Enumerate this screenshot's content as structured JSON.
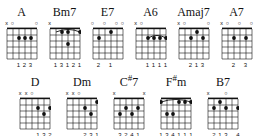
{
  "sheet": {
    "title": "Guitar Chord Chart",
    "strings": 6,
    "frets": 5,
    "ink_color": "#111111",
    "paper_color": "#ffffff"
  },
  "rows": [
    {
      "chords": [
        {
          "name": "A",
          "name_root": "A",
          "name_suffix": "",
          "markers": [
            "x",
            "o",
            "",
            "",
            "",
            "o"
          ],
          "dots": [
            {
              "string": 3,
              "fret": 2
            },
            {
              "string": 4,
              "fret": 2
            },
            {
              "string": 5,
              "fret": 2
            }
          ],
          "barre": null,
          "fingers": [
            "",
            "",
            "1",
            "2",
            "3",
            ""
          ]
        },
        {
          "name": "Bm7",
          "name_root": "Bm",
          "name_suffix": "7",
          "markers": [
            "x",
            "",
            "",
            "",
            "",
            ""
          ],
          "dots": [
            {
              "string": 3,
              "fret": 1
            },
            {
              "string": 4,
              "fret": 1
            },
            {
              "string": 6,
              "fret": 1
            },
            {
              "string": 4,
              "fret": 3
            }
          ],
          "barre": {
            "fret": 1,
            "from": 2,
            "to": 6
          },
          "fingers": [
            "",
            "1",
            "3",
            "1",
            "2",
            "1"
          ]
        },
        {
          "name": "E7",
          "name_root": "E",
          "name_suffix": "7",
          "markers": [
            "o",
            "",
            "o",
            "",
            "o",
            "o"
          ],
          "dots": [
            {
              "string": 2,
              "fret": 2
            },
            {
              "string": 4,
              "fret": 1
            }
          ],
          "barre": null,
          "fingers": [
            "",
            "2",
            "",
            "1",
            "",
            ""
          ]
        },
        {
          "name": "A6",
          "name_root": "A",
          "name_suffix": "6",
          "markers": [
            "x",
            "o",
            "",
            "",
            "",
            ""
          ],
          "dots": [
            {
              "string": 3,
              "fret": 2
            },
            {
              "string": 4,
              "fret": 2
            },
            {
              "string": 5,
              "fret": 2
            },
            {
              "string": 6,
              "fret": 2
            }
          ],
          "barre": {
            "fret": 2,
            "from": 3,
            "to": 6
          },
          "fingers": [
            "",
            "",
            "1",
            "1",
            "1",
            "1"
          ]
        },
        {
          "name": "Amaj7",
          "name_root": "Amaj",
          "name_suffix": "7",
          "markers": [
            "x",
            "o",
            "",
            "",
            "",
            "o"
          ],
          "dots": [
            {
              "string": 3,
              "fret": 2
            },
            {
              "string": 4,
              "fret": 1
            },
            {
              "string": 5,
              "fret": 2
            }
          ],
          "barre": null,
          "fingers": [
            "",
            "",
            "2",
            "1",
            "3",
            ""
          ]
        },
        {
          "name": "A7",
          "name_root": "A",
          "name_suffix": "7",
          "markers": [
            "x",
            "o",
            "",
            "o",
            "",
            "o"
          ],
          "dots": [
            {
              "string": 3,
              "fret": 2
            },
            {
              "string": 5,
              "fret": 2
            }
          ],
          "barre": null,
          "fingers": [
            "",
            "",
            "2",
            "",
            "3",
            ""
          ]
        }
      ]
    },
    {
      "chords": [
        {
          "name": "D",
          "name_root": "D",
          "name_suffix": "",
          "markers": [
            "x",
            "x",
            "o",
            "",
            "",
            ""
          ],
          "dots": [
            {
              "string": 4,
              "fret": 2
            },
            {
              "string": 5,
              "fret": 3
            },
            {
              "string": 6,
              "fret": 2
            }
          ],
          "barre": null,
          "fingers": [
            "",
            "",
            "",
            "1",
            "3",
            "2"
          ]
        },
        {
          "name": "Dm",
          "name_root": "Dm",
          "name_suffix": "",
          "markers": [
            "x",
            "x",
            "o",
            "",
            "",
            ""
          ],
          "dots": [
            {
              "string": 4,
              "fret": 2
            },
            {
              "string": 5,
              "fret": 3
            },
            {
              "string": 6,
              "fret": 1
            }
          ],
          "barre": null,
          "fingers": [
            "",
            "",
            "",
            "2",
            "3",
            "1"
          ]
        },
        {
          "name": "C#7",
          "name_root": "C",
          "name_suffix": "#7",
          "markers": [
            "x",
            "",
            "",
            "",
            "",
            "x"
          ],
          "dots": [
            {
              "string": 2,
              "fret": 3
            },
            {
              "string": 3,
              "fret": 2
            },
            {
              "string": 4,
              "fret": 3
            },
            {
              "string": 5,
              "fret": 2
            }
          ],
          "barre": null,
          "fingers": [
            "",
            "3",
            "2",
            "4",
            "1",
            ""
          ]
        },
        {
          "name": "F#m",
          "name_root": "F",
          "name_suffix": "#m",
          "markers": [
            "",
            "",
            "",
            "",
            "",
            ""
          ],
          "dots": [
            {
              "string": 1,
              "fret": 1
            },
            {
              "string": 2,
              "fret": 3
            },
            {
              "string": 3,
              "fret": 3
            },
            {
              "string": 4,
              "fret": 1
            },
            {
              "string": 5,
              "fret": 1
            },
            {
              "string": 6,
              "fret": 1
            }
          ],
          "barre": {
            "fret": 1,
            "from": 1,
            "to": 6
          },
          "fingers": [
            "1",
            "3",
            "4",
            "1",
            "1",
            "1"
          ]
        },
        {
          "name": "B7",
          "name_root": "B",
          "name_suffix": "7",
          "markers": [
            "x",
            "",
            "",
            "o",
            "",
            ""
          ],
          "dots": [
            {
              "string": 2,
              "fret": 2
            },
            {
              "string": 3,
              "fret": 1
            },
            {
              "string": 4,
              "fret": 2
            },
            {
              "string": 6,
              "fret": 2
            }
          ],
          "barre": null,
          "fingers": [
            "",
            "2",
            "1",
            "3",
            "",
            "4"
          ]
        }
      ]
    }
  ]
}
